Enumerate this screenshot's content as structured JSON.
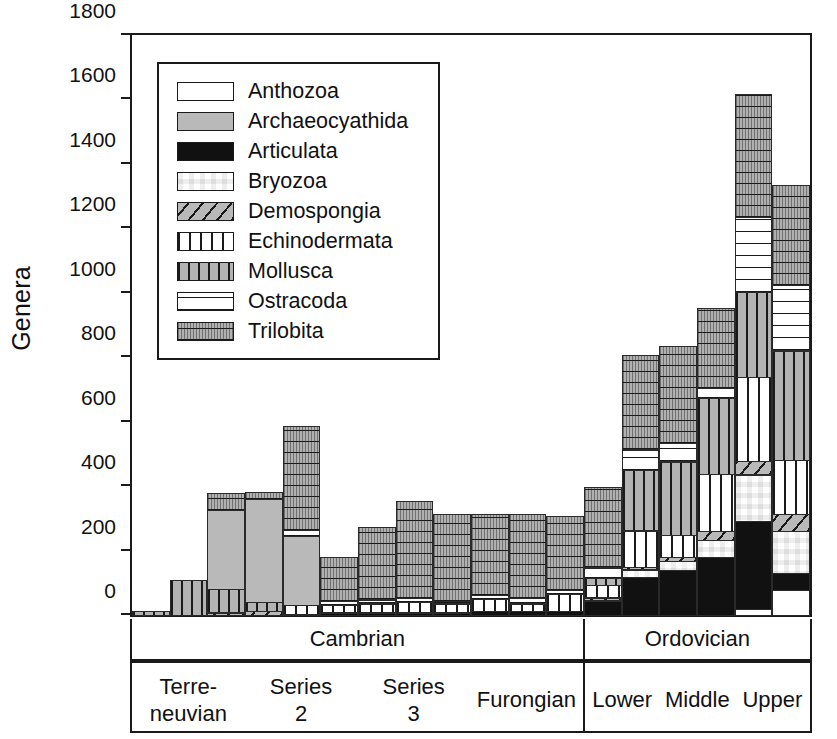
{
  "axis": {
    "ylabel": "Genera",
    "yticks": [
      0,
      200,
      400,
      600,
      800,
      1000,
      1200,
      1400,
      1600,
      1800
    ],
    "ymax": 1800,
    "ymin": 0
  },
  "legend": {
    "position": "inside-top-left",
    "items": [
      {
        "label": "Anthozoa",
        "pattern": "empty-white",
        "key": "anthozoa"
      },
      {
        "label": "Archaeocyathida",
        "pattern": "solid-gray",
        "key": "archaeocyathida"
      },
      {
        "label": "Articulata",
        "pattern": "solid-black",
        "key": "articulata"
      },
      {
        "label": "Bryozoa",
        "pattern": "checkerboard",
        "key": "bryozoa"
      },
      {
        "label": "Demospongia",
        "pattern": "diagonal-hatch-gray",
        "key": "demospongia"
      },
      {
        "label": "Echinodermata",
        "pattern": "vertical-lines-white",
        "key": "echinodermata"
      },
      {
        "label": "Mollusca",
        "pattern": "vertical-lines-gray",
        "key": "mollusca"
      },
      {
        "label": "Ostracoda",
        "pattern": "horizontal-lines-white",
        "key": "ostracoda"
      },
      {
        "label": "Trilobita",
        "pattern": "stipple-gray-lines",
        "key": "trilobita"
      }
    ]
  },
  "stages": {
    "tier1": [
      {
        "label": "Cambrian",
        "bars": 12
      },
      {
        "label": "Ordovician",
        "bars": 6
      }
    ],
    "tier2": [
      {
        "group": "Cambrian",
        "cells": [
          {
            "lines": [
              "Terre-",
              "neuvian"
            ],
            "bars": 3
          },
          {
            "lines": [
              "Series",
              "2"
            ],
            "bars": 3
          },
          {
            "lines": [
              "Series",
              "3"
            ],
            "bars": 3
          },
          {
            "lines": [
              "Furongian"
            ],
            "bars": 3
          }
        ]
      },
      {
        "group": "Ordovician",
        "cells": [
          {
            "lines": [
              "Lower"
            ],
            "bars": 2
          },
          {
            "lines": [
              "Middle"
            ],
            "bars": 2
          },
          {
            "lines": [
              "Upper"
            ],
            "bars": 2
          }
        ]
      }
    ]
  },
  "chart_data": {
    "type": "bar",
    "subtype": "stacked-bar",
    "title": "",
    "xlabel": "",
    "ylabel": "Genera",
    "ylim": [
      0,
      1800
    ],
    "grid": false,
    "stack_order_bottom_to_top": [
      "Anthozoa",
      "Articulata",
      "Bryozoa",
      "Demospongia",
      "Echinodermata",
      "Mollusca",
      "Archaeocyathida",
      "Ostracoda",
      "Trilobita"
    ],
    "categories": [
      "Terreneuvian-1",
      "Terreneuvian-2",
      "Terreneuvian-3",
      "Series2-1",
      "Series2-2",
      "Series2-3",
      "Series3-1",
      "Series3-2",
      "Series3-3",
      "Furongian-1",
      "Furongian-2",
      "Furongian-3",
      "Lower-1",
      "Lower-2",
      "Middle-1",
      "Middle-2",
      "Upper-1",
      "Upper-2"
    ],
    "series": [
      {
        "name": "Anthozoa",
        "values": [
          0,
          0,
          0,
          0,
          0,
          0,
          0,
          0,
          0,
          0,
          0,
          0,
          0,
          0,
          0,
          0,
          20,
          80
        ]
      },
      {
        "name": "Articulata",
        "values": [
          0,
          0,
          0,
          0,
          5,
          10,
          10,
          10,
          10,
          15,
          15,
          15,
          45,
          120,
          140,
          180,
          275,
          55
        ]
      },
      {
        "name": "Bryozoa",
        "values": [
          0,
          0,
          0,
          0,
          0,
          0,
          0,
          0,
          0,
          0,
          0,
          0,
          5,
          25,
          30,
          55,
          145,
          130
        ]
      },
      {
        "name": "Demospongia",
        "values": [
          0,
          0,
          10,
          15,
          0,
          0,
          0,
          0,
          0,
          0,
          0,
          0,
          10,
          10,
          15,
          30,
          45,
          55
        ]
      },
      {
        "name": "Echinodermata",
        "values": [
          0,
          0,
          0,
          0,
          30,
          25,
          30,
          35,
          30,
          40,
          25,
          55,
          40,
          115,
          70,
          180,
          260,
          170
        ]
      },
      {
        "name": "Mollusca",
        "values": [
          15,
          110,
          75,
          30,
          0,
          0,
          0,
          0,
          0,
          0,
          0,
          0,
          25,
          190,
          230,
          235,
          265,
          340
        ]
      },
      {
        "name": "Archaeocyathida",
        "values": [
          0,
          0,
          245,
          320,
          215,
          0,
          0,
          0,
          0,
          0,
          0,
          0,
          0,
          0,
          0,
          0,
          0,
          0
        ]
      },
      {
        "name": "Ostracoda",
        "values": [
          0,
          0,
          0,
          0,
          20,
          15,
          15,
          15,
          10,
          15,
          20,
          15,
          35,
          65,
          60,
          35,
          235,
          205
        ]
      },
      {
        "name": "Trilobita",
        "values": [
          0,
          0,
          55,
          25,
          325,
          140,
          225,
          300,
          270,
          250,
          260,
          230,
          250,
          295,
          300,
          250,
          380,
          310
        ]
      }
    ],
    "totals": [
      15,
      110,
      385,
      390,
      615,
      190,
      280,
      360,
      320,
      320,
      320,
      315,
      410,
      820,
      845,
      965,
      1625,
      1345
    ]
  }
}
